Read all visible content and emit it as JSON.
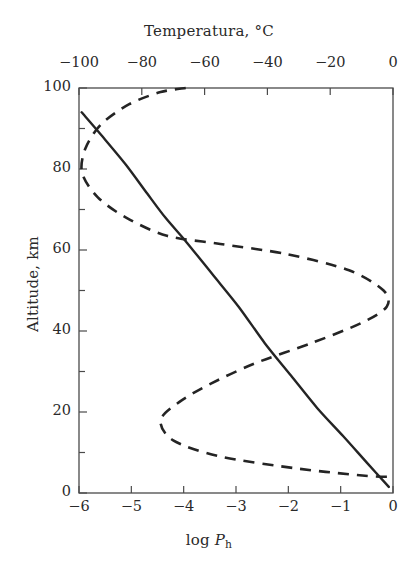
{
  "figure": {
    "top_axis_title": "Temperatura, °C",
    "bottom_axis_title_prefix": "log ",
    "bottom_axis_title_symbol": "P",
    "bottom_axis_title_subscript": "h",
    "y_axis_title": "Altitude, km",
    "background_color": "#ffffff",
    "line_color": "#242424",
    "axis_color": "#4a4a4a"
  },
  "chart_data": {
    "type": "line",
    "title": "",
    "subtitle": "",
    "xlabel": "log P_h",
    "xlabel_top": "Temperatura, °C",
    "ylabel": "Altitude, km",
    "xlim": [
      -6,
      0
    ],
    "ylim": [
      0,
      100
    ],
    "xlim_top": [
      -110,
      0
    ],
    "grid": false,
    "legend": "none",
    "x_ticks": [
      -6,
      -5,
      -4,
      -3,
      -2,
      -1,
      0
    ],
    "x_tick_labels": [
      "−6",
      "−5",
      "−4",
      "−3",
      "−2",
      "−1",
      "0"
    ],
    "x_ticks_top": [
      -100,
      -80,
      -60,
      -40,
      -20,
      0
    ],
    "x_tick_labels_top": [
      "−100",
      "−80",
      "−60",
      "−40",
      "−20",
      "0"
    ],
    "y_ticks": [
      0,
      20,
      40,
      60,
      80,
      100
    ],
    "y_tick_labels": [
      "0",
      "20",
      "40",
      "60",
      "80",
      "100"
    ],
    "y_minor_ticks": [
      10,
      30,
      50,
      70,
      90
    ],
    "note_right_labels_clipped": "The 0 labels on both horizontal axes are clipped at the right image edge",
    "series": [
      {
        "name": "log P_h (pressure profile)",
        "style": "solid",
        "x_axis": "bottom",
        "points": [
          {
            "log_p": -5.95,
            "altitude_km": 94.0
          },
          {
            "log_p": -5.55,
            "altitude_km": 88.0
          },
          {
            "log_p": -5.1,
            "altitude_km": 81.0
          },
          {
            "log_p": -4.7,
            "altitude_km": 74.0
          },
          {
            "log_p": -4.35,
            "altitude_km": 68.0
          },
          {
            "log_p": -3.95,
            "altitude_km": 62.0
          },
          {
            "log_p": -3.45,
            "altitude_km": 54.0
          },
          {
            "log_p": -2.95,
            "altitude_km": 46.0
          },
          {
            "log_p": -2.45,
            "altitude_km": 37.0
          },
          {
            "log_p": -1.95,
            "altitude_km": 29.0
          },
          {
            "log_p": -1.45,
            "altitude_km": 21.0
          },
          {
            "log_p": -0.95,
            "altitude_km": 14.0
          },
          {
            "log_p": -0.5,
            "altitude_km": 7.5
          },
          {
            "log_p": -0.08,
            "altitude_km": 1.5
          }
        ]
      },
      {
        "name": "Temperatura (temperature profile)",
        "style": "dashed",
        "x_axis": "top",
        "points": [
          {
            "temperature_c": -66.0,
            "altitude_km": 100.0
          },
          {
            "temperature_c": -74.0,
            "altitude_km": 99.0
          },
          {
            "temperature_c": -84.0,
            "altitude_km": 96.0
          },
          {
            "temperature_c": -93.0,
            "altitude_km": 91.0
          },
          {
            "temperature_c": -98.0,
            "altitude_km": 85.0
          },
          {
            "temperature_c": -99.0,
            "altitude_km": 79.0
          },
          {
            "temperature_c": -94.0,
            "altitude_km": 73.0
          },
          {
            "temperature_c": -85.0,
            "altitude_km": 68.0
          },
          {
            "temperature_c": -72.0,
            "altitude_km": 63.5
          },
          {
            "temperature_c": -55.0,
            "altitude_km": 61.5
          },
          {
            "temperature_c": -34.0,
            "altitude_km": 59.0
          },
          {
            "temperature_c": -14.0,
            "altitude_km": 55.0
          },
          {
            "temperature_c": -3.0,
            "altitude_km": 50.0
          },
          {
            "temperature_c": -2.0,
            "altitude_km": 46.0
          },
          {
            "temperature_c": -10.0,
            "altitude_km": 42.0
          },
          {
            "temperature_c": -26.0,
            "altitude_km": 37.0
          },
          {
            "temperature_c": -44.0,
            "altitude_km": 32.0
          },
          {
            "temperature_c": -58.0,
            "altitude_km": 27.0
          },
          {
            "temperature_c": -68.0,
            "altitude_km": 22.5
          },
          {
            "temperature_c": -74.0,
            "altitude_km": 18.0
          },
          {
            "temperature_c": -70.0,
            "altitude_km": 13.0
          },
          {
            "temperature_c": -55.0,
            "altitude_km": 9.0
          },
          {
            "temperature_c": -30.0,
            "altitude_km": 6.0
          },
          {
            "temperature_c": -8.0,
            "altitude_km": 4.2
          },
          {
            "temperature_c": 0.0,
            "altitude_km": 4.0
          }
        ]
      }
    ],
    "annotations": [
      {
        "text": "mesopause (temperature minimum)",
        "altitude_km": 79,
        "temperature_c": -99
      },
      {
        "text": "stratopause (temperature maximum)",
        "altitude_km": 48,
        "temperature_c": -2
      },
      {
        "text": "tropopause (temperature minimum)",
        "altitude_km": 18,
        "temperature_c": -74
      }
    ]
  },
  "axis_geometry": {
    "plot_left_px": 79,
    "plot_right_px": 393,
    "plot_top_px": 88,
    "plot_bottom_px": 493
  }
}
